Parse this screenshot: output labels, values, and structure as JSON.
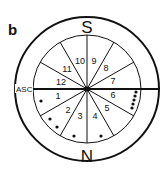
{
  "panel_label": "b",
  "top_label": "S",
  "bottom_label": "N",
  "ascendant_label": "ASC",
  "houses": [
    {
      "n": "1",
      "x": 58,
      "y": 99
    },
    {
      "n": "2",
      "x": 68,
      "y": 113
    },
    {
      "n": "3",
      "x": 80,
      "y": 119
    },
    {
      "n": "4",
      "x": 95,
      "y": 119
    },
    {
      "n": "5",
      "x": 107,
      "y": 111
    },
    {
      "n": "6",
      "x": 113,
      "y": 98
    },
    {
      "n": "7",
      "x": 113,
      "y": 84
    },
    {
      "n": "8",
      "x": 106,
      "y": 71
    },
    {
      "n": "9",
      "x": 94,
      "y": 64
    },
    {
      "n": "10",
      "x": 80,
      "y": 64
    },
    {
      "n": "11",
      "x": 67,
      "y": 72
    },
    {
      "n": "12",
      "x": 61,
      "y": 85
    }
  ],
  "dots": [
    {
      "x": 41,
      "y": 101
    },
    {
      "x": 50,
      "y": 119
    },
    {
      "x": 57,
      "y": 127
    },
    {
      "x": 74,
      "y": 136
    },
    {
      "x": 101,
      "y": 136
    },
    {
      "x": 136,
      "y": 92
    },
    {
      "x": 135,
      "y": 96
    },
    {
      "x": 134,
      "y": 100
    },
    {
      "x": 133,
      "y": 104
    },
    {
      "x": 132,
      "y": 108
    }
  ],
  "colors": {
    "ink": "#111111",
    "background": "#ffffff"
  }
}
